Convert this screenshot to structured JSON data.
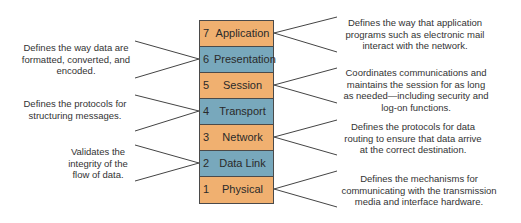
{
  "colors": {
    "upper_orange": "#f0b070",
    "blue": "#78a8bc",
    "border": "#4a4a4a"
  },
  "layers": [
    {
      "num": "7",
      "name": "Application",
      "color": "#f0b070"
    },
    {
      "num": "6",
      "name": "Presentation",
      "color": "#78a8bc"
    },
    {
      "num": "5",
      "name": "Session",
      "color": "#f0b070"
    },
    {
      "num": "4",
      "name": "Transport",
      "color": "#78a8bc"
    },
    {
      "num": "3",
      "name": "Network",
      "color": "#f0b070"
    },
    {
      "num": "2",
      "name": "Data Link",
      "color": "#78a8bc"
    },
    {
      "num": "1",
      "name": "Physical",
      "color": "#f0b070"
    }
  ],
  "descriptions": {
    "application": "Defines the way that application programs such as electronic mail interact with the network.",
    "presentation": "Defines the way data are formatted, converted, and encoded.",
    "session": "Coordinates communications and maintains the session for as long as needed—including security and log-on functions.",
    "transport": "Defines the protocols for structuring messages.",
    "network": "Defines the protocols for data routing to ensure that data arrive at the correct destination.",
    "data_link": "Validates the integrity of the flow of data.",
    "physical": "Defines the mechanisms for communicating with the transmission media and interface hardware."
  }
}
